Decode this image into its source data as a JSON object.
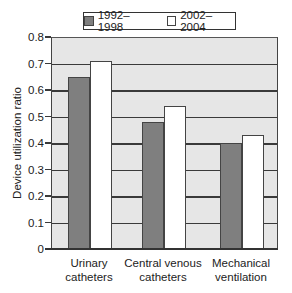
{
  "chart_data": {
    "type": "bar",
    "title": "",
    "xlabel": "",
    "ylabel": "Device utilization ratio",
    "ylim": [
      0,
      0.8
    ],
    "yticks": [
      "0",
      "0.1",
      "0.2",
      "0.3",
      "0.4",
      "0.5",
      "0.6",
      "0.7",
      "0.8"
    ],
    "grid": true,
    "legend_position": "top",
    "categories": [
      "Urinary\ncatheters",
      "Central venous\ncatheters",
      "Mechanical\nventilation"
    ],
    "series": [
      {
        "name": "1992–1998",
        "color": "#7f7f7f",
        "values": [
          0.65,
          0.48,
          0.4
        ]
      },
      {
        "name": "2002–2004",
        "color": "#ffffff",
        "values": [
          0.71,
          0.54,
          0.43
        ]
      }
    ]
  },
  "legend": {
    "items": [
      {
        "label": "1992–1998",
        "color": "#7f7f7f"
      },
      {
        "label": "2002–2004",
        "color": "#ffffff"
      }
    ]
  },
  "axes": {
    "ylabel": "Device utilization ratio",
    "yticks": [
      "0",
      "0.1",
      "0.2",
      "0.3",
      "0.4",
      "0.5",
      "0.6",
      "0.7",
      "0.8"
    ],
    "xcategories": [
      {
        "line1": "Urinary",
        "line2": "catheters"
      },
      {
        "line1": "Central venous",
        "line2": "catheters"
      },
      {
        "line1": "Mechanical",
        "line2": "ventilation"
      }
    ]
  }
}
